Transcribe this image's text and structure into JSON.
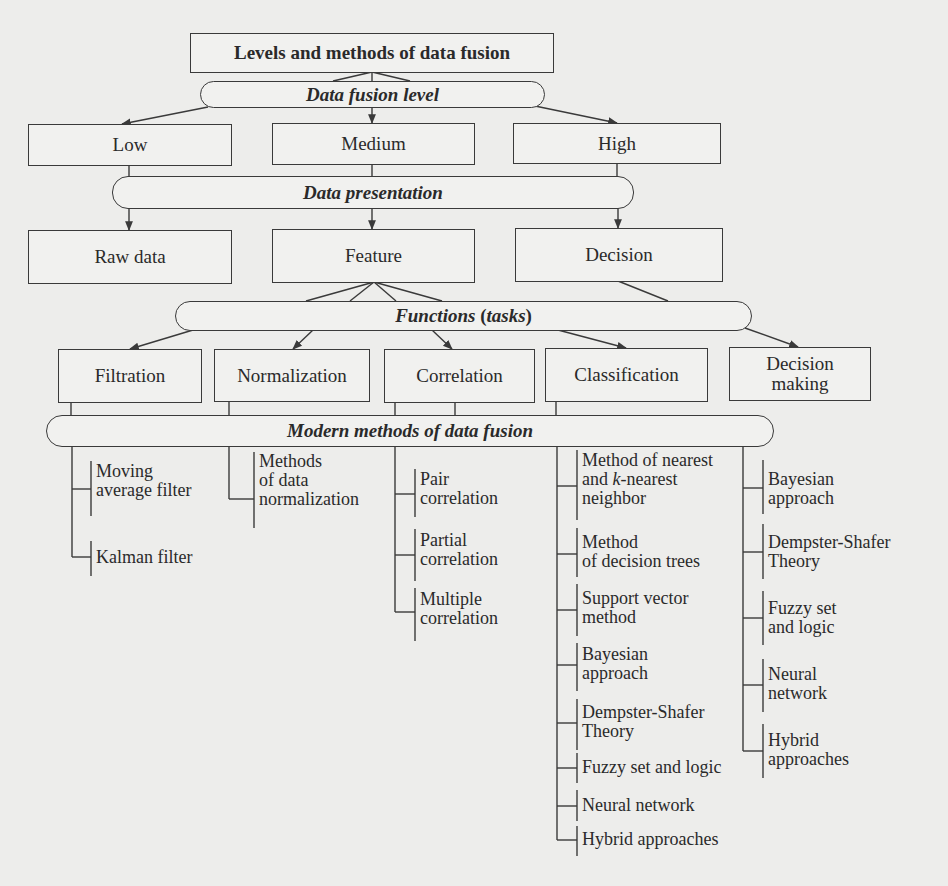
{
  "title": "Levels and methods of data fusion",
  "stages": {
    "fusion_level": {
      "label": "Data fusion level",
      "items": [
        "Low",
        "Medium",
        "High"
      ]
    },
    "presentation": {
      "label": "Data presentation",
      "items": [
        "Raw data",
        "Feature",
        "Decision"
      ]
    },
    "functions": {
      "label_main": "Functions",
      "label_paren_open": " (",
      "label_tasks": "tasks",
      "label_paren_close": ")",
      "items": [
        "Filtration",
        "Normalization",
        "Correlation",
        "Classification",
        "Decision making"
      ]
    },
    "methods": {
      "label": "Modern methods of data fusion"
    }
  },
  "methods": {
    "filtration": [
      "Moving average filter",
      "Kalman filter"
    ],
    "normalization": [
      "Methods of data normalization"
    ],
    "correlation": [
      "Pair correlation",
      "Partial correlation",
      "Multiple correlation"
    ],
    "classification": [
      "Method of nearest and k-nearest neighbor",
      "Method of decision trees",
      "Support vector method",
      "Bayesian approach",
      "Dempster-Shafer Theory",
      "Fuzzy set and logic",
      "Neural network",
      "Hybrid approaches"
    ],
    "decision_making": [
      "Bayesian approach",
      "Dempster-Shafer Theory",
      "Fuzzy set and logic",
      "Neural network",
      "Hybrid approaches"
    ]
  },
  "leaf_lines": {
    "moving_1": "Moving",
    "moving_2": "average filter",
    "kalman": "Kalman filter",
    "norm_1": "Methods",
    "norm_2": "of data",
    "norm_3": "normalization",
    "pair_1": "Pair",
    "pair_2": "correlation",
    "partial_1": "Partial",
    "partial_2": "correlation",
    "multiple_1": "Multiple",
    "multiple_2": "correlation",
    "knn_1": "Method of nearest",
    "knn_2a": "and ",
    "knn_2k": "k",
    "knn_2b": "-nearest",
    "knn_3": "neighbor",
    "tree_1": "Method",
    "tree_2": "of decision trees",
    "svm_1": "Support vector",
    "svm_2": "method",
    "cbayes_1": "Bayesian",
    "cbayes_2": "approach",
    "cds_1": "Dempster-Shafer",
    "cds_2": "Theory",
    "cfuzzy": "Fuzzy set and logic",
    "cneural": "Neural network",
    "chybrid": "Hybrid approaches",
    "dbayes_1": "Bayesian",
    "dbayes_2": "approach",
    "dds_1": "Dempster-Shafer",
    "dds_2": "Theory",
    "dfuzzy_1": "Fuzzy set",
    "dfuzzy_2": "and logic",
    "dneural_1": "Neural",
    "dneural_2": "network",
    "dhybrid_1": "Hybrid",
    "dhybrid_2": "approaches"
  },
  "colors": {
    "background": "#ededeb",
    "stroke": "#3a3a3a",
    "text": "#2a2a2a"
  }
}
